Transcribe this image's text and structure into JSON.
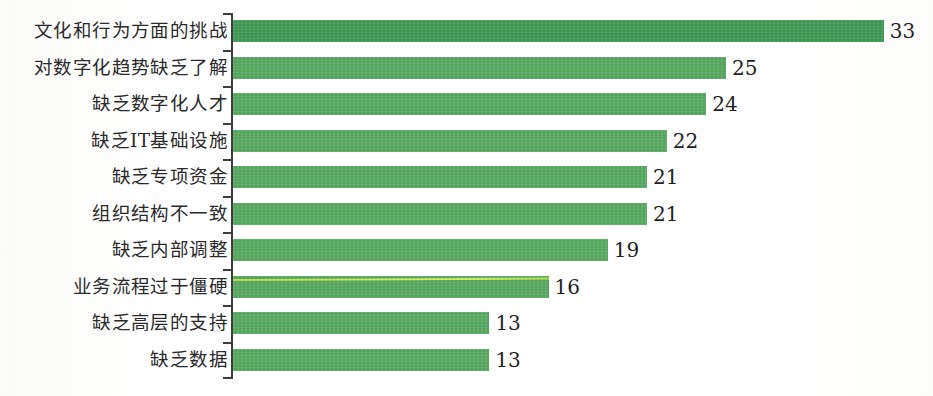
{
  "chart_data": {
    "type": "bar",
    "orientation": "horizontal",
    "title": "",
    "subtitle": "",
    "xlabel": "",
    "ylabel": "",
    "categories": [
      "文化和行为方面的挑战",
      "对数字化趋势缺乏了解",
      "缺乏数字化人才",
      "缺乏IT基础设施",
      "缺乏专项资金",
      "组织结构不一致",
      "缺乏内部调整",
      "业务流程过于僵硬",
      "缺乏高层的支持",
      "缺乏数据"
    ],
    "values": [
      33,
      25,
      24,
      22,
      21,
      21,
      19,
      16,
      13,
      13
    ],
    "value_labels": [
      "33",
      "25",
      "24",
      "22",
      "21",
      "21",
      "19",
      "16",
      "13",
      "13"
    ],
    "xlim": [
      0,
      35
    ],
    "grid": false,
    "legend": false,
    "legend_position": "none",
    "series": [
      {
        "name": "",
        "values": [
          33,
          25,
          24,
          22,
          21,
          21,
          19,
          16,
          13,
          13
        ],
        "color": "#57a95f"
      }
    ],
    "bar_color": "#57a95f",
    "bar_color_top": "#3f9a54",
    "axis_color": "#3d3d3d",
    "label_color": "#2a2a2a",
    "value_color": "#1f1f1f",
    "background": "#ffffff",
    "axis": {
      "y_axis_visible": true,
      "x_axis_visible": false,
      "tick_count": 11
    },
    "annotations": [
      {
        "kind": "scan-artifact",
        "on_category": "业务流程过于僵硬",
        "color": "#cdeb58"
      }
    ]
  }
}
